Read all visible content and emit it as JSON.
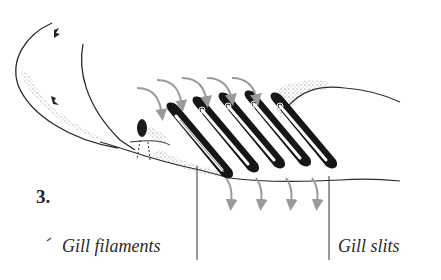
{
  "figure": {
    "number": "3.",
    "arrow_color": "#9a9a9a",
    "ink_color": "#1a1a1a",
    "stipple_color": "#555555"
  },
  "labels": {
    "gill_filaments": "Gill filaments",
    "gill_slits": "Gill slits"
  },
  "arrows": {
    "incoming_count": 5,
    "outgoing_count": 4
  },
  "gill_arches": {
    "count": 5
  }
}
